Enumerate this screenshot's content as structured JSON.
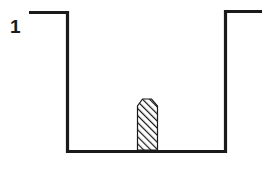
{
  "figure": {
    "label": "1",
    "colors": {
      "stroke": "#1a1a1a",
      "background": "#ffffff",
      "hatch": "#1a1a1a"
    },
    "elements": [
      {
        "name": "left-ledge"
      },
      {
        "name": "left-wall"
      },
      {
        "name": "floor"
      },
      {
        "name": "right-wall"
      },
      {
        "name": "right-ledge"
      },
      {
        "name": "hatched-object"
      }
    ]
  }
}
